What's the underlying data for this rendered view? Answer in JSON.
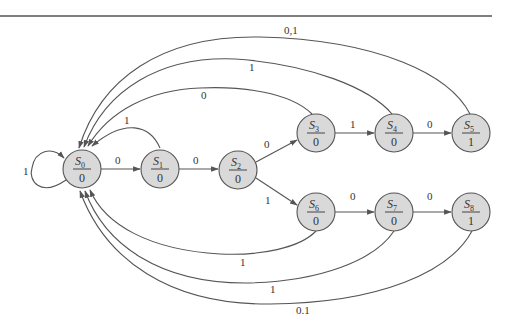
{
  "diagram": {
    "type": "finite-state machine (Moore)",
    "colors": {
      "node_fill": "#d9d9d9",
      "stroke": "#555555",
      "text": "#333333"
    },
    "states": [
      {
        "id": "S0",
        "letter": "S",
        "index": "0",
        "output": "0"
      },
      {
        "id": "S1",
        "letter": "S",
        "index": "1",
        "output": "0"
      },
      {
        "id": "S2",
        "letter": "S",
        "index": "2",
        "output": "0"
      },
      {
        "id": "S3",
        "letter": "S",
        "index": "3",
        "output": "0"
      },
      {
        "id": "S4",
        "letter": "S",
        "index": "4",
        "output": "0"
      },
      {
        "id": "S5",
        "letter": "S",
        "index": "5",
        "output": "1"
      },
      {
        "id": "S6",
        "letter": "S",
        "index": "6",
        "output": "0"
      },
      {
        "id": "S7",
        "letter": "S",
        "index": "7",
        "output": "0"
      },
      {
        "id": "S8",
        "letter": "S",
        "index": "8",
        "output": "1"
      }
    ],
    "transitions": [
      {
        "from": "S0",
        "to": "S0",
        "label": "1"
      },
      {
        "from": "S0",
        "to": "S1",
        "label": "0"
      },
      {
        "from": "S1",
        "to": "S0",
        "label": "1"
      },
      {
        "from": "S1",
        "to": "S2",
        "label": "0"
      },
      {
        "from": "S2",
        "to": "S3",
        "label": "0"
      },
      {
        "from": "S2",
        "to": "S6",
        "label": "1"
      },
      {
        "from": "S3",
        "to": "S4",
        "label": "1"
      },
      {
        "from": "S3",
        "to": "S0",
        "label": "0"
      },
      {
        "from": "S4",
        "to": "S5",
        "label": "0"
      },
      {
        "from": "S4",
        "to": "S0",
        "label": "1"
      },
      {
        "from": "S5",
        "to": "S0",
        "label": "0,1"
      },
      {
        "from": "S6",
        "to": "S7",
        "label": "0"
      },
      {
        "from": "S6",
        "to": "S0",
        "label": "1"
      },
      {
        "from": "S7",
        "to": "S8",
        "label": "0"
      },
      {
        "from": "S7",
        "to": "S0",
        "label": "1"
      },
      {
        "from": "S8",
        "to": "S0",
        "label": "0.1"
      }
    ]
  }
}
